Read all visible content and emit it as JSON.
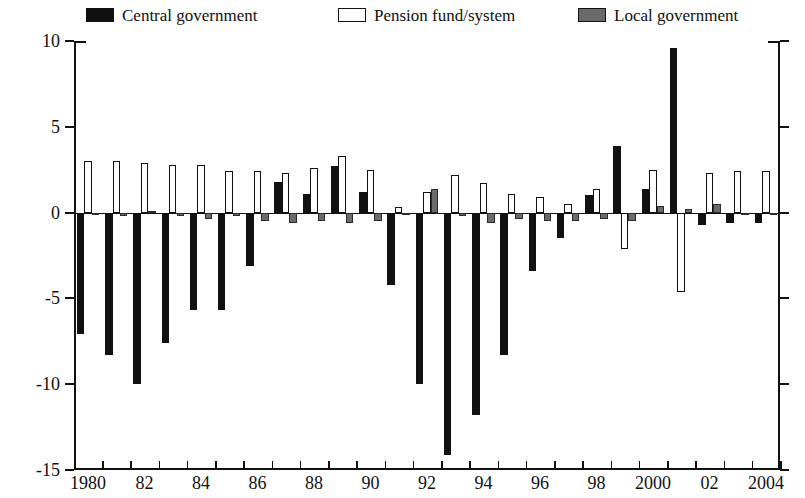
{
  "legend": {
    "items": [
      {
        "label": "Central government",
        "key": "central",
        "color": "#111111",
        "swatch": "filled-black-swatch"
      },
      {
        "label": "Pension fund/system",
        "key": "pension",
        "color": "#ffffff",
        "swatch": "hollow-white-swatch"
      },
      {
        "label": "Local government",
        "key": "local",
        "color": "#6b6b6b",
        "swatch": "filled-gray-swatch"
      }
    ],
    "position": "top"
  },
  "axes": {
    "y_ticks": [
      "10",
      "5",
      "0",
      "-5",
      "-10",
      "-15"
    ],
    "x_ticks": [
      "1980",
      "82",
      "84",
      "86",
      "88",
      "90",
      "92",
      "94",
      "96",
      "98",
      "2000",
      "02",
      "2004"
    ]
  },
  "chart_data": {
    "type": "bar",
    "title": "",
    "subtitle": "",
    "xlabel": "",
    "ylabel": "",
    "ylim": [
      -15,
      10
    ],
    "ytick_values": [
      10,
      5,
      0,
      -5,
      -10,
      -15
    ],
    "grid": false,
    "legend_position": "top",
    "categories": [
      "1980",
      "1981",
      "1982",
      "1983",
      "1984",
      "1985",
      "1986",
      "1987",
      "1988",
      "1989",
      "1990",
      "1991",
      "1992",
      "1993",
      "1994",
      "1995",
      "1996",
      "1997",
      "1998",
      "1999",
      "2000",
      "2001",
      "2002",
      "2003",
      "2004"
    ],
    "xtick_labels": [
      "1980",
      "82",
      "84",
      "86",
      "88",
      "90",
      "92",
      "94",
      "96",
      "98",
      "2000",
      "02",
      "2004"
    ],
    "series": [
      {
        "name": "Central government",
        "color": "#111111",
        "values": [
          -7.1,
          -8.3,
          -10.0,
          -7.6,
          -5.7,
          -5.7,
          -3.1,
          1.8,
          1.1,
          2.7,
          1.2,
          -4.2,
          -10.0,
          -14.1,
          -11.8,
          -8.3,
          -3.4,
          -1.5,
          1.0,
          3.9,
          1.4,
          9.6,
          -0.7,
          -0.6,
          -0.6
        ]
      },
      {
        "name": "Pension fund/system",
        "color": "#ffffff",
        "values": [
          3.0,
          3.0,
          2.9,
          2.8,
          2.8,
          2.4,
          2.4,
          2.3,
          2.6,
          3.3,
          2.5,
          0.3,
          1.2,
          2.2,
          1.7,
          1.1,
          0.9,
          0.5,
          1.4,
          -2.1,
          2.5,
          -4.6,
          2.3,
          2.4,
          2.4
        ]
      },
      {
        "name": "Local government",
        "color": "#6b6b6b",
        "values": [
          -0.1,
          -0.2,
          0.1,
          -0.2,
          -0.4,
          -0.2,
          -0.5,
          -0.6,
          -0.5,
          -0.6,
          -0.5,
          -0.1,
          1.4,
          -0.2,
          -0.6,
          -0.4,
          -0.5,
          -0.5,
          -0.4,
          -0.5,
          0.4,
          0.2,
          0.5,
          -0.1,
          -0.1
        ]
      }
    ]
  }
}
